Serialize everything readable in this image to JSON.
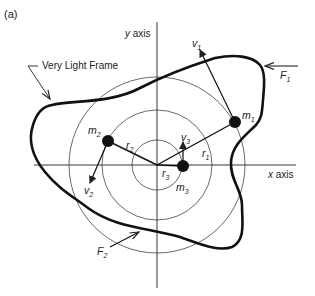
{
  "figure": {
    "panel_label": "(a)",
    "y_axis_label": "y axis",
    "x_axis_label": "x axis",
    "frame_label": "Very Light Frame",
    "masses": [
      {
        "name": "m",
        "sub": "1",
        "radius_label": "r",
        "radius_sub": "1",
        "velocity_label": "v",
        "velocity_sub": "1"
      },
      {
        "name": "m",
        "sub": "2",
        "radius_label": "r",
        "radius_sub": "2",
        "velocity_label": "v",
        "velocity_sub": "2"
      },
      {
        "name": "m",
        "sub": "3",
        "radius_label": "r",
        "radius_sub": "3",
        "velocity_label": "v",
        "velocity_sub": "3"
      }
    ],
    "forces": [
      {
        "name": "F",
        "sub": "1"
      },
      {
        "name": "F",
        "sub": "2"
      }
    ]
  }
}
